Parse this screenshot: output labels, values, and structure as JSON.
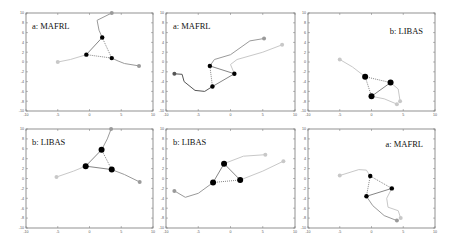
{
  "chart_data": [
    {
      "type": "scatter",
      "title": "a: MAFRL",
      "xlim": [
        -10,
        10
      ],
      "ylim": [
        -10,
        10
      ],
      "xticks": [
        -10,
        -5,
        0,
        5,
        10
      ],
      "yticks": [
        -10,
        -8,
        -6,
        -4,
        -2,
        0,
        2,
        4,
        6,
        8,
        10
      ],
      "title_pos": "top-left",
      "agents": [
        [
          -0.5,
          1.5
        ],
        [
          2,
          5
        ],
        [
          3.5,
          0.8
        ]
      ],
      "start_points": [
        [
          -5,
          0
        ],
        [
          3.5,
          10
        ],
        [
          7.8,
          -0.8
        ]
      ],
      "paths": [
        {
          "shade": "light",
          "points": [
            [
              -5,
              0
            ],
            [
              -3,
              0.5
            ],
            [
              -0.5,
              1.5
            ]
          ]
        },
        {
          "shade": "mid",
          "points": [
            [
              3.5,
              10
            ],
            [
              1.2,
              8.5
            ],
            [
              1.5,
              6.5
            ],
            [
              2,
              5
            ]
          ]
        },
        {
          "shade": "mid",
          "points": [
            [
              7.8,
              -0.8
            ],
            [
              5.5,
              -0.3
            ],
            [
              4.5,
              0.2
            ],
            [
              3.5,
              0.8
            ]
          ]
        }
      ],
      "formation": {
        "solid": [
          [
            -0.5,
            1.5
          ],
          [
            2,
            5
          ]
        ],
        "dotted": [
          [
            [
              2,
              5
            ],
            [
              3.5,
              0.8
            ]
          ],
          [
            [
              -0.5,
              1.5
            ],
            [
              3.5,
              0.8
            ]
          ]
        ]
      }
    },
    {
      "type": "scatter",
      "title": "a: MAFRL",
      "xlim": [
        -10,
        10
      ],
      "ylim": [
        -10,
        10
      ],
      "xticks": [
        -10,
        -5,
        0,
        5,
        10
      ],
      "yticks": [
        -10,
        -8,
        -6,
        -4,
        -2,
        0,
        2,
        4,
        6,
        8,
        10
      ],
      "title_pos": "top-left",
      "agents": [
        [
          -3.2,
          -0.8
        ],
        [
          0.6,
          -2.4
        ],
        [
          -2.8,
          -5
        ]
      ],
      "start_points": [
        [
          -8.7,
          -2.4
        ],
        [
          5.2,
          4.8
        ],
        [
          8,
          3.5
        ]
      ],
      "paths": [
        {
          "shade": "dark",
          "points": [
            [
              -8.7,
              -2.4
            ],
            [
              -7.5,
              -2.5
            ],
            [
              -7.2,
              -4
            ],
            [
              -5.5,
              -5.8
            ],
            [
              -4,
              -6
            ],
            [
              -2.8,
              -5
            ]
          ]
        },
        {
          "shade": "mid",
          "points": [
            [
              5.2,
              4.8
            ],
            [
              3,
              4.3
            ],
            [
              0,
              1.5
            ],
            [
              -2.5,
              0.5
            ],
            [
              -3.2,
              -0.8
            ]
          ]
        },
        {
          "shade": "light",
          "points": [
            [
              8,
              3.5
            ],
            [
              5,
              2
            ],
            [
              1,
              0.5
            ],
            [
              0,
              -0.5
            ],
            [
              0.6,
              -2.4
            ]
          ]
        }
      ],
      "formation": {
        "solid": [
          [
            [
              -3.2,
              -0.8
            ],
            [
              0.6,
              -2.4
            ]
          ],
          [
            [
              0.6,
              -2.4
            ],
            [
              -2.8,
              -5
            ]
          ]
        ],
        "dotted": [
          [
            [
              -3.2,
              -0.8
            ],
            [
              -2.8,
              -5
            ]
          ]
        ]
      }
    },
    {
      "type": "scatter",
      "title": "b: LIBAS",
      "xlim": [
        -10,
        10
      ],
      "ylim": [
        -10,
        10
      ],
      "xticks": [
        -10,
        -5,
        0,
        5,
        10
      ],
      "yticks": [
        -10,
        -8,
        -6,
        -4,
        -2,
        0,
        2,
        4,
        6,
        8,
        10
      ],
      "title_pos": "top-right",
      "agents": [
        [
          -1,
          -3
        ],
        [
          3,
          -4.2
        ],
        [
          0,
          -7
        ]
      ],
      "start_points": [
        [
          -5,
          0.5
        ],
        [
          4,
          -8.6
        ],
        [
          4.5,
          -8
        ]
      ],
      "paths": [
        {
          "shade": "light",
          "points": [
            [
              -5,
              0.5
            ],
            [
              -3,
              -1
            ],
            [
              -1,
              -3
            ]
          ]
        },
        {
          "shade": "light",
          "points": [
            [
              4,
              -8.6
            ],
            [
              2,
              -7.5
            ],
            [
              0,
              -7
            ]
          ]
        },
        {
          "shade": "light",
          "points": [
            [
              4.5,
              -8
            ],
            [
              4.2,
              -5.5
            ],
            [
              3,
              -4.2
            ]
          ]
        }
      ],
      "formation": {
        "solid": [
          [
            [
              3,
              -4.2
            ],
            [
              0,
              -7
            ]
          ]
        ],
        "dotted": [
          [
            [
              -1,
              -3
            ],
            [
              3,
              -4.2
            ]
          ],
          [
            [
              -1,
              -3
            ],
            [
              0,
              -7
            ]
          ]
        ]
      }
    },
    {
      "type": "scatter",
      "title": "b: LIBAS",
      "xlim": [
        -10,
        10
      ],
      "ylim": [
        -10,
        10
      ],
      "xticks": [
        -10,
        -5,
        0,
        5,
        10
      ],
      "yticks": [
        -10,
        -8,
        -6,
        -4,
        -2,
        0,
        2,
        4,
        6,
        8,
        10
      ],
      "title_pos": "top-left",
      "agents": [
        [
          -0.6,
          2.5
        ],
        [
          1.9,
          5.8
        ],
        [
          3.5,
          1.8
        ]
      ],
      "start_points": [
        [
          -5.2,
          0.3
        ],
        [
          3.4,
          10
        ],
        [
          7.9,
          -0.7
        ]
      ],
      "paths": [
        {
          "shade": "light",
          "points": [
            [
              -5.2,
              0.3
            ],
            [
              -2.5,
              1.5
            ],
            [
              -0.6,
              2.5
            ]
          ]
        },
        {
          "shade": "mid",
          "points": [
            [
              3.4,
              10
            ],
            [
              2.8,
              8
            ],
            [
              1.9,
              5.8
            ]
          ]
        },
        {
          "shade": "mid",
          "points": [
            [
              7.9,
              -0.7
            ],
            [
              5.5,
              0.8
            ],
            [
              3.5,
              1.8
            ]
          ]
        }
      ],
      "formation": {
        "solid": [
          [
            [
              -0.6,
              2.5
            ],
            [
              1.9,
              5.8
            ]
          ],
          [
            [
              -0.6,
              2.5
            ],
            [
              3.5,
              1.8
            ]
          ]
        ],
        "dotted": [
          [
            [
              1.9,
              5.8
            ],
            [
              3.5,
              1.8
            ]
          ]
        ]
      }
    },
    {
      "type": "scatter",
      "title": "b: LIBAS",
      "xlim": [
        -10,
        10
      ],
      "ylim": [
        -10,
        10
      ],
      "xticks": [
        -10,
        -5,
        0,
        5,
        10
      ],
      "yticks": [
        -10,
        -8,
        -6,
        -4,
        -2,
        0,
        2,
        4,
        6,
        8,
        10
      ],
      "title_pos": "top-left",
      "agents": [
        [
          -1,
          3
        ],
        [
          1.5,
          -0.3
        ],
        [
          -2.7,
          -0.8
        ]
      ],
      "start_points": [
        [
          -8.7,
          -2.5
        ],
        [
          5.4,
          4.8
        ],
        [
          8.2,
          3.5
        ]
      ],
      "paths": [
        {
          "shade": "mid",
          "points": [
            [
              -8.7,
              -2.5
            ],
            [
              -7,
              -3.8
            ],
            [
              -5,
              -3
            ],
            [
              -2.7,
              -0.8
            ]
          ]
        },
        {
          "shade": "light",
          "points": [
            [
              5.4,
              4.8
            ],
            [
              2,
              4.5
            ],
            [
              -1,
              3
            ]
          ]
        },
        {
          "shade": "light",
          "points": [
            [
              8.2,
              3.5
            ],
            [
              5,
              1.5
            ],
            [
              1.5,
              -0.3
            ]
          ]
        }
      ],
      "formation": {
        "solid": [
          [
            [
              -1,
              3
            ],
            [
              -2.7,
              -0.8
            ]
          ],
          [
            [
              -1,
              3
            ],
            [
              1.5,
              -0.3
            ]
          ]
        ],
        "dotted": [
          [
            [
              -2.7,
              -0.8
            ],
            [
              1.5,
              -0.3
            ]
          ]
        ]
      }
    },
    {
      "type": "scatter",
      "title": "a: MAFRL",
      "xlim": [
        -10,
        10
      ],
      "ylim": [
        -10,
        10
      ],
      "xticks": [
        -10,
        -5,
        0,
        5,
        10
      ],
      "yticks": [
        -10,
        -8,
        -6,
        -4,
        -2,
        0,
        2,
        4,
        6,
        8,
        10
      ],
      "title_pos": "top-right",
      "agents": [
        [
          -0.2,
          0.5
        ],
        [
          3.2,
          -2
        ],
        [
          -0.8,
          -3.6
        ]
      ],
      "start_points": [
        [
          -5,
          0.6
        ],
        [
          4,
          -8.5
        ],
        [
          4.6,
          -8
        ]
      ],
      "paths": [
        {
          "shade": "light",
          "points": [
            [
              -5,
              0.6
            ],
            [
              -2,
              1.8
            ],
            [
              -0.8,
              1.7
            ],
            [
              -0.2,
              0.5
            ]
          ]
        },
        {
          "shade": "mid",
          "points": [
            [
              4,
              -8.5
            ],
            [
              2,
              -7.5
            ],
            [
              0.2,
              -5.5
            ],
            [
              -0.8,
              -3.6
            ]
          ]
        },
        {
          "shade": "light",
          "points": [
            [
              4.6,
              -8
            ],
            [
              4.2,
              -6.5
            ],
            [
              2.6,
              -5.8
            ],
            [
              2.4,
              -4
            ],
            [
              3.2,
              -2
            ]
          ]
        }
      ],
      "formation": {
        "solid": [
          [
            [
              -0.8,
              -3.6
            ],
            [
              3.2,
              -2
            ]
          ]
        ],
        "dotted": [
          [
            [
              -0.2,
              0.5
            ],
            [
              3.2,
              -2
            ]
          ],
          [
            [
              -0.2,
              0.5
            ],
            [
              -0.8,
              -3.6
            ]
          ]
        ]
      }
    }
  ],
  "panels": [
    {
      "title": "a: MAFRL"
    },
    {
      "title": "a: MAFRL"
    },
    {
      "title": "b: LIBAS"
    },
    {
      "title": "b: LIBAS"
    },
    {
      "title": "b: LIBAS"
    },
    {
      "title": "a: MAFRL"
    }
  ]
}
